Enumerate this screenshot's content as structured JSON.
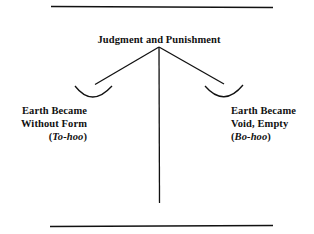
{
  "diagram": {
    "title": "Judgment and Punishment",
    "left_pan": {
      "line1": "Earth Became",
      "line2": "Without Form",
      "paren_open": "(",
      "hebrew": "To-hoo",
      "paren_close": ")"
    },
    "right_pan": {
      "line1": "Earth Became",
      "line2": "Void, Empty",
      "paren_open": "(",
      "hebrew": "Bo-hoo",
      "paren_close": ")"
    },
    "colors": {
      "ink": "#111111",
      "background": "#ffffff"
    }
  }
}
